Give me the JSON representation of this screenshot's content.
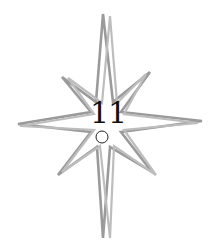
{
  "figure": {
    "label": "11",
    "shape": "eight-pointed-star",
    "icon": "star-outline-icon",
    "marker": "small-circle",
    "colors": {
      "background": "#ffffff",
      "stroke_outer": "#9a9a9a",
      "stroke_inner": "#b8b8b8",
      "label": "#111111",
      "marker": "#222222"
    }
  }
}
